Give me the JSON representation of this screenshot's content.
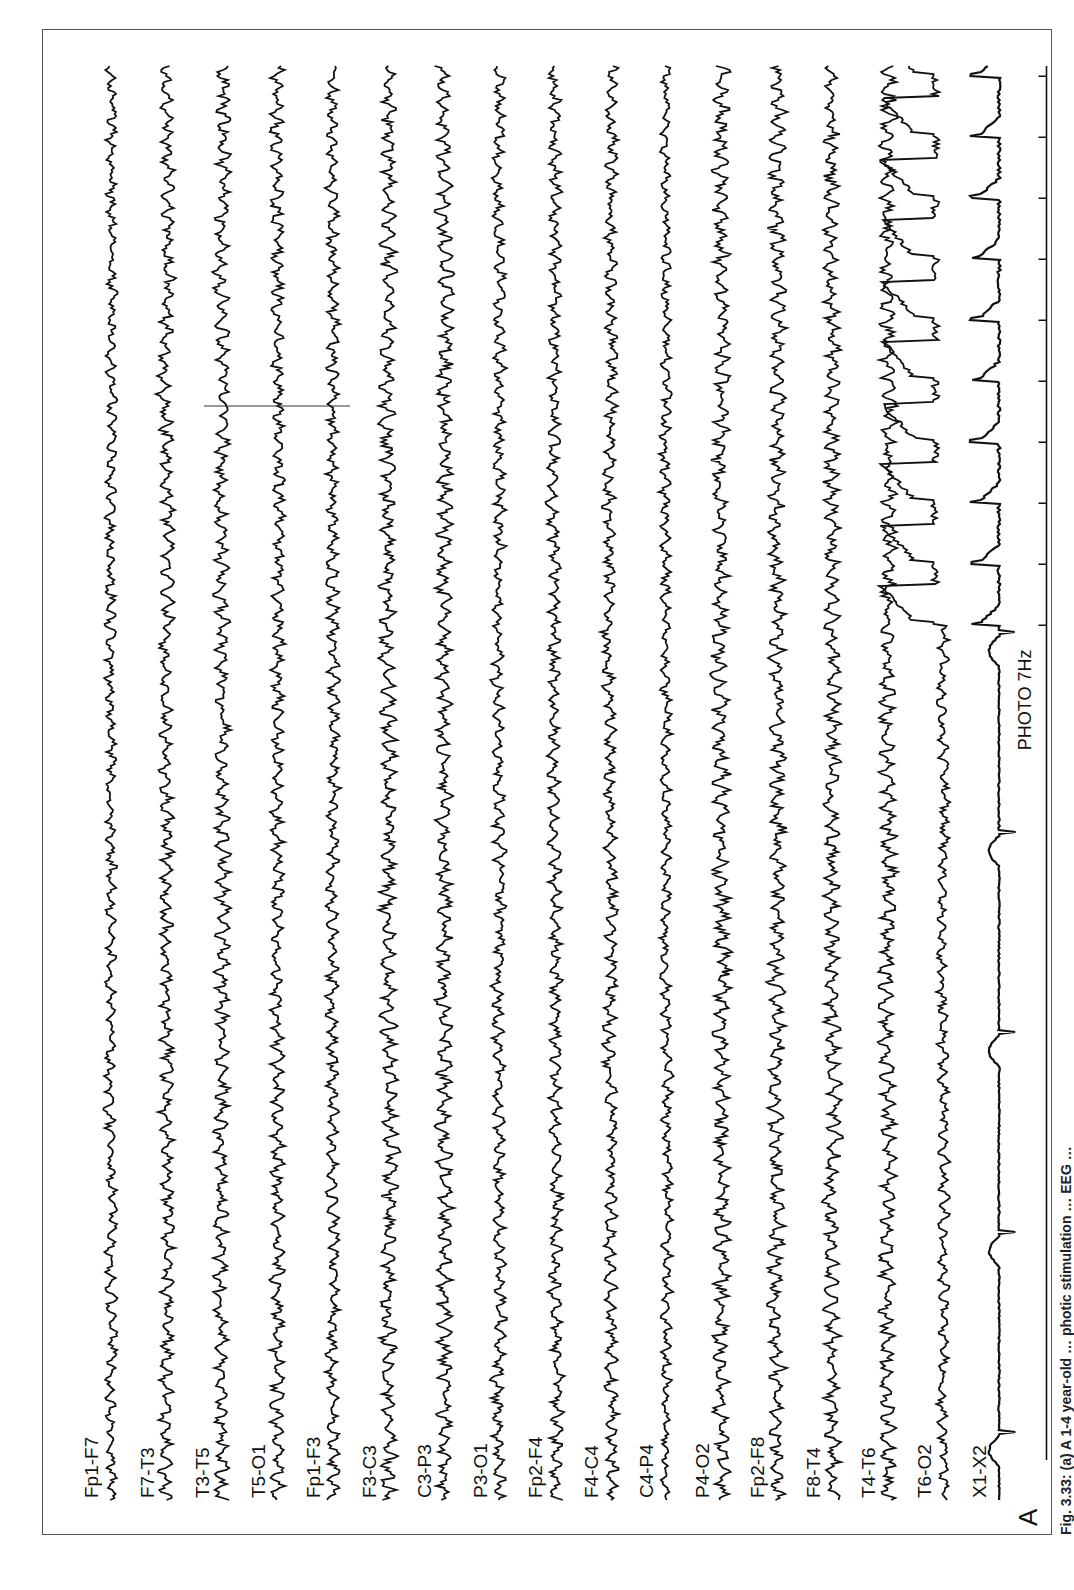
{
  "figure": {
    "panel_letter": "A",
    "caption": "Fig. 3.33: (a) A 1-4 year-old … photic stimulation … EEG …",
    "stimulus_label": "PHOTO 7Hz",
    "stimulus_frequency_hz": 7,
    "orientation": "rotated 90° counterclockwise",
    "artifact_marker_channels": [
      "T3-T5",
      "T5-O1",
      "Fp1-F3"
    ]
  },
  "channels": [
    {
      "label": "Fp1-F7",
      "type": "eeg"
    },
    {
      "label": "F7-T3",
      "type": "eeg"
    },
    {
      "label": "T3-T5",
      "type": "eeg"
    },
    {
      "label": "T5-O1",
      "type": "eeg"
    },
    {
      "label": "Fp1-F3",
      "type": "eeg"
    },
    {
      "label": "F3-C3",
      "type": "eeg"
    },
    {
      "label": "C3-P3",
      "type": "eeg"
    },
    {
      "label": "P3-O1",
      "type": "eeg"
    },
    {
      "label": "Fp2-F4",
      "type": "eeg"
    },
    {
      "label": "F4-C4",
      "type": "eeg"
    },
    {
      "label": "C4-P4",
      "type": "eeg"
    },
    {
      "label": "P4-O2",
      "type": "eeg"
    },
    {
      "label": "Fp2-F8",
      "type": "eeg"
    },
    {
      "label": "F8-T4",
      "type": "eeg"
    },
    {
      "label": "T4-T6",
      "type": "eeg"
    },
    {
      "label": "T6-O2",
      "type": "eeg"
    },
    {
      "label": "X1-X2",
      "type": "ecg"
    }
  ],
  "stimulus_channel": {
    "label": "photic",
    "onset_fraction": 0.61
  },
  "colors": {
    "trace": "#111111",
    "frame": "#555555",
    "background": "#ffffff"
  }
}
